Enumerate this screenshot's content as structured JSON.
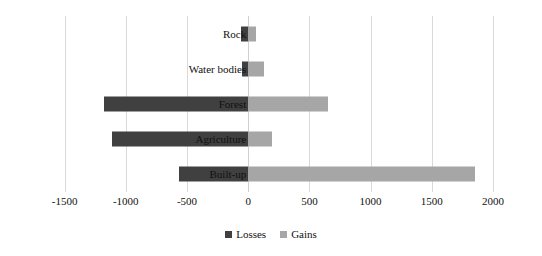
{
  "chart_data": {
    "type": "bar",
    "orientation": "horizontal",
    "title": "",
    "xlabel": "",
    "ylabel": "",
    "xlim": [
      -1750,
      2090
    ],
    "xticks": [
      -1500,
      -1000,
      -500,
      0,
      500,
      1000,
      1500,
      2000
    ],
    "xtick_labels": [
      "-1500",
      "-1000",
      "-500",
      "0",
      "500",
      "1000",
      "1500",
      "2000"
    ],
    "grid": true,
    "legend_position": "bottom",
    "categories": [
      "Rock",
      "Water bodies",
      "Forest",
      "Agriculture",
      "Built-up"
    ],
    "series": [
      {
        "name": "Losses",
        "color": "#404040",
        "values": [
          -55,
          -50,
          -1180,
          -1110,
          -565
        ]
      },
      {
        "name": "Gains",
        "color": "#a6a6a6",
        "values": [
          60,
          130,
          650,
          195,
          1850
        ]
      }
    ]
  },
  "legend": {
    "items": [
      {
        "label": "Losses",
        "swatch": "losses-swatch"
      },
      {
        "label": "Gains",
        "swatch": "gains-swatch"
      }
    ]
  },
  "colors": {
    "losses": "#404040",
    "gains": "#a6a6a6",
    "gridline": "#d9d9d9",
    "text": "#111111",
    "background": "#ffffff"
  }
}
